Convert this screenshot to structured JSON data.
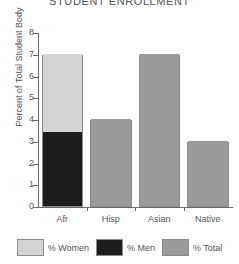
{
  "chart_data": {
    "type": "bar",
    "title": "STUDENT ENROLLMENT",
    "xlabel": "",
    "ylabel": "Percent of Total Student Body",
    "categories": [
      "Afr",
      "Hisp",
      "Asian",
      "Native"
    ],
    "ylim": [
      0,
      8
    ],
    "yticks": [
      0,
      1,
      2,
      3,
      4,
      5,
      6,
      7,
      8
    ],
    "ytick_labels": [
      "0",
      "1",
      "2",
      "3",
      "4",
      "5",
      "6",
      "7",
      "8"
    ],
    "grid": false,
    "legend_position": "bottom",
    "stacked": true,
    "series": [
      {
        "name": "% Men",
        "color": "#1c1c1c",
        "values": [
          3.4,
          null,
          null,
          null
        ]
      },
      {
        "name": "% Women",
        "color": "#d3d3d3",
        "values": [
          3.6,
          null,
          null,
          null
        ]
      },
      {
        "name": "% Total",
        "color": "#9a9a9a",
        "values": [
          null,
          4.0,
          7.0,
          3.0
        ]
      }
    ],
    "totals": [
      7.0,
      4.0,
      7.0,
      3.0
    ],
    "legend": [
      {
        "label": "% Women",
        "color": "#d3d3d3"
      },
      {
        "label": "% Men",
        "color": "#1c1c1c"
      },
      {
        "label": "% Total",
        "color": "#9a9a9a"
      }
    ]
  }
}
